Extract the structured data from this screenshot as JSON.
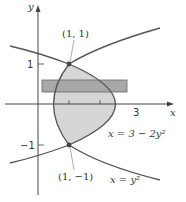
{
  "figure": {
    "x_axis_label": "x",
    "y_axis_label": "y",
    "tick_labels": {
      "y_pos": "1",
      "y_neg": "−1",
      "x_three": "3"
    },
    "points": [
      {
        "label": "(1, 1)",
        "x": 1,
        "y": 1
      },
      {
        "label": "(1, −1)",
        "x": 1,
        "y": -1
      }
    ],
    "curves": [
      {
        "label": "x = 3 − 2y²",
        "equation": "x = 3 - 2y^2"
      },
      {
        "label": "x = y²",
        "equation": "x = y^2"
      }
    ],
    "shaded_region": "region bounded by x = y^2 and x = 3 - 2y^2",
    "strip": "horizontal approximating rectangle",
    "colors": {
      "region_fill": "#d6d6d6",
      "strip_fill": "#a8a8a8",
      "curve_stroke": "#555555",
      "axis_stroke": "#444444"
    }
  }
}
